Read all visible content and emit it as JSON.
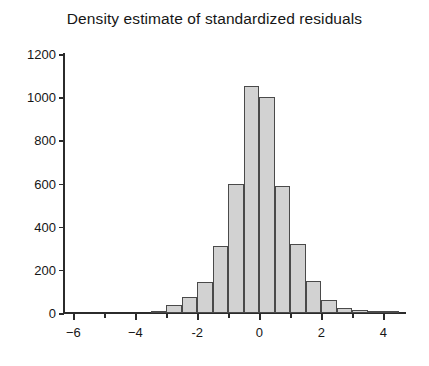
{
  "chart_data": {
    "type": "bar",
    "title": "Density estimate of standardized residuals",
    "subtitle": "",
    "xlabel": "",
    "ylabel": "",
    "xlim": [
      -6.3,
      4.7
    ],
    "ylim": [
      0,
      1200
    ],
    "grid": false,
    "legend": null,
    "bin_width": 0.5,
    "bar_style": {
      "fill": "#d2d2d2",
      "edge": "#4a4a4a"
    },
    "x_ticks_major": [
      -6,
      -4,
      -2,
      0,
      2,
      4
    ],
    "x_tick_labels": [
      "−6",
      "−4",
      "-2",
      "0",
      "2",
      "4"
    ],
    "x_ticks_minor": [
      -5,
      -3,
      -1,
      1,
      3
    ],
    "y_ticks": [
      0,
      200,
      400,
      600,
      800,
      1000,
      1200
    ],
    "y_tick_labels": [
      "0",
      "200",
      "400",
      "600",
      "800",
      "1000",
      "1200"
    ],
    "bin_edges": [
      -3.5,
      -3.0,
      -2.5,
      -2.0,
      -1.5,
      -1.0,
      -0.5,
      0.0,
      0.5,
      1.0,
      1.5,
      2.0,
      2.5,
      3.0,
      3.5,
      4.0,
      4.5
    ],
    "bin_centers": [
      -3.25,
      -2.75,
      -2.25,
      -1.75,
      -1.25,
      -0.75,
      -0.25,
      0.25,
      0.75,
      1.25,
      1.75,
      2.25,
      2.75,
      3.25,
      3.75,
      4.25
    ],
    "values": [
      10,
      35,
      75,
      145,
      310,
      600,
      1050,
      1000,
      590,
      320,
      150,
      60,
      25,
      12,
      6,
      3
    ]
  }
}
